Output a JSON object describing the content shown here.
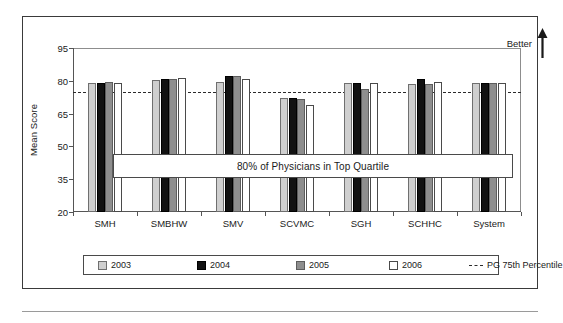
{
  "figure": {
    "better_label": "Better",
    "arrow_icon": "up-arrow-icon",
    "annotation": "80% of Physicians in Top Quartile"
  },
  "chart_data": {
    "type": "bar",
    "title": "",
    "xlabel": "",
    "ylabel": "Mean Score",
    "ylim": [
      20,
      95
    ],
    "yticks": [
      20,
      35,
      50,
      65,
      80,
      95
    ],
    "grid": false,
    "legend_position": "bottom",
    "categories": [
      "SMH",
      "SMBHW",
      "SMV",
      "SCVMC",
      "SGH",
      "SCHHC",
      "System"
    ],
    "series": [
      {
        "name": "2003",
        "color": "#cfcfcf",
        "values": [
          78.8,
          80.4,
          79.4,
          72.0,
          79.0,
          78.4,
          78.8
        ]
      },
      {
        "name": "2004",
        "color": "#121212",
        "values": [
          79.0,
          81.0,
          82.0,
          72.2,
          79.2,
          80.6,
          79.2
        ]
      },
      {
        "name": "2005",
        "color": "#8e8e8e",
        "values": [
          79.4,
          80.6,
          82.2,
          71.6,
          76.4,
          78.4,
          78.8
        ]
      },
      {
        "name": "2006",
        "color": "#ffffff",
        "values": [
          78.8,
          81.4,
          80.8,
          68.8,
          79.0,
          79.6,
          78.8
        ]
      }
    ],
    "reference_line": {
      "name": "PG 75th Percentile",
      "value": 75.0,
      "style": "dashed",
      "color": "#2b2b2b"
    },
    "annotations": [
      {
        "text": "80% of Physicians in Top Quartile",
        "y_range": [
          35.5,
          46.5
        ]
      },
      {
        "text": "Better",
        "position": "top-right",
        "icon": "up-arrow-icon"
      }
    ]
  }
}
